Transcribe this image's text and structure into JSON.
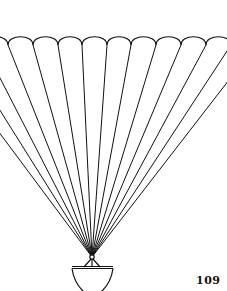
{
  "page": {
    "page_number": "109",
    "illustration": {
      "subject": "parachute-with-basket",
      "stroke_color": "#111111",
      "background_color": "#ffffff",
      "canopy": {
        "cusp_y": 45,
        "arc_top_y": 36,
        "cusp_x": [
          -66,
          -41,
          -17,
          8,
          33,
          58,
          82,
          107,
          131,
          156,
          181,
          206,
          231,
          256
        ]
      },
      "convergence_point": {
        "x": 92,
        "y": 257
      },
      "basket": {
        "rim_y": 267,
        "rim_left_x": 72,
        "rim_right_x": 113,
        "bottom_y": 291
      }
    }
  }
}
